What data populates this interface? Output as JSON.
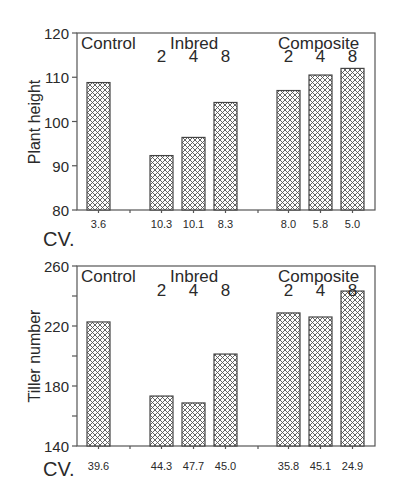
{
  "chart_data": [
    {
      "type": "bar",
      "title": "",
      "ylabel": "Plant height",
      "xlabel": "",
      "ylim": [
        80,
        120
      ],
      "yticks": [
        80,
        90,
        100,
        110,
        120
      ],
      "groups": [
        {
          "name": "Control",
          "sublabels": [
            ""
          ]
        },
        {
          "name": "Inbred",
          "sublabels": [
            "2",
            "4",
            "8"
          ]
        },
        {
          "name": "Composite",
          "sublabels": [
            "2",
            "4",
            "8"
          ]
        }
      ],
      "categories": [
        "Control",
        "Inbred 2",
        "Inbred 4",
        "Inbred 8",
        "Composite 2",
        "Composite 4",
        "Composite 8"
      ],
      "values": [
        108.8,
        92.3,
        96.4,
        104.3,
        107.0,
        110.5,
        112.0
      ],
      "cv_label": "CV.",
      "cv_values": [
        "3.6",
        "10.3",
        "10.1",
        "8.3",
        "8.0",
        "5.8",
        "5.0"
      ],
      "grid": false,
      "pattern": "crosshatch"
    },
    {
      "type": "bar",
      "title": "",
      "ylabel": "Tiller number",
      "xlabel": "",
      "ylim": [
        140,
        260
      ],
      "yticks": [
        140,
        180,
        220,
        260
      ],
      "minor_yticks": [
        160,
        200,
        240
      ],
      "groups": [
        {
          "name": "Control",
          "sublabels": [
            ""
          ]
        },
        {
          "name": "Inbred",
          "sublabels": [
            "2",
            "4",
            "8"
          ]
        },
        {
          "name": "Composite",
          "sublabels": [
            "2",
            "4",
            "8"
          ]
        }
      ],
      "categories": [
        "Control",
        "Inbred 2",
        "Inbred 4",
        "Inbred 8",
        "Composite 2",
        "Composite 4",
        "Composite 8"
      ],
      "values": [
        222.7,
        173.3,
        168.7,
        201.3,
        228.7,
        226.0,
        243.3
      ],
      "cv_label": "CV.",
      "cv_values": [
        "39.6",
        "44.3",
        "47.7",
        "45.0",
        "35.8",
        "45.1",
        "24.9"
      ],
      "grid": false,
      "pattern": "crosshatch"
    }
  ]
}
